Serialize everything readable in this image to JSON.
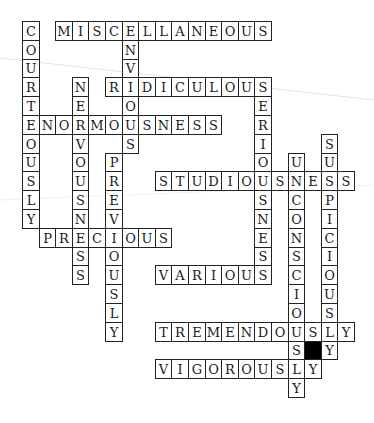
{
  "puzzle": {
    "type": "crossword",
    "grid": {
      "origin_x": 22,
      "origin_y": 21,
      "cell_w": 16.6,
      "cell_h": 18.8,
      "cols": 20,
      "rows": 20
    },
    "words": [
      {
        "text": "MISCELLANEOUS",
        "dir": "across",
        "row": 0,
        "col": 2
      },
      {
        "text": "RIDICULOUS",
        "dir": "across",
        "row": 3,
        "col": 5
      },
      {
        "text": "ENORMOUSNESS",
        "dir": "across",
        "row": 5,
        "col": 0
      },
      {
        "text": "STUDIOUSNESS",
        "dir": "across",
        "row": 8,
        "col": 8
      },
      {
        "text": "PRECIOUS",
        "dir": "across",
        "row": 11,
        "col": 1
      },
      {
        "text": "VARIOUS",
        "dir": "across",
        "row": 13,
        "col": 8
      },
      {
        "text": "TREMENDOUSLY",
        "dir": "across",
        "row": 16,
        "col": 8
      },
      {
        "text": "VIGOROUSLY",
        "dir": "across",
        "row": 18,
        "col": 8
      },
      {
        "text": "COURTEOUSLY",
        "dir": "down",
        "row": 0,
        "col": 0
      },
      {
        "text": "ENVIOUS",
        "dir": "down",
        "row": 0,
        "col": 6
      },
      {
        "text": "NERVOUSNESS",
        "dir": "down",
        "row": 3,
        "col": 3
      },
      {
        "text": "SERIOUSNESS",
        "dir": "down",
        "row": 3,
        "col": 14
      },
      {
        "text": "PREVIOUSLY",
        "dir": "down",
        "row": 7,
        "col": 5
      },
      {
        "text": "UNCONSCIOUSLY",
        "dir": "down",
        "row": 7,
        "col": 16
      },
      {
        "text": "SUSPICIOUSLY",
        "dir": "down",
        "row": 6,
        "col": 18
      }
    ],
    "black_cells": [
      {
        "row": 17,
        "col": 17
      }
    ]
  }
}
